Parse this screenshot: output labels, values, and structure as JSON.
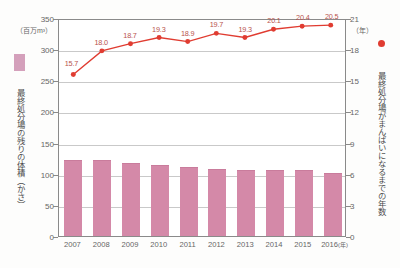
{
  "chart_data": {
    "type": "bar",
    "title": "",
    "subtitle": "",
    "categories": [
      "2007",
      "2008",
      "2009",
      "2010",
      "2011",
      "2012",
      "2013",
      "2014",
      "2015",
      "2016"
    ],
    "xlabel": "(年)",
    "grid": true,
    "legend_position": "outside-left-and-right",
    "series": [
      {
        "name": "最終処分場の残りの体積（かさ）",
        "type": "bar",
        "axis": "left",
        "unit": "（百万m³）",
        "color": "#d489a8",
        "values": [
          120,
          120,
          115,
          112,
          109,
          106,
          104,
          104,
          104,
          99
        ]
      },
      {
        "name": "最終処分場がまんぱいになるまでの年数",
        "type": "line",
        "axis": "right",
        "unit": "（年）",
        "color": "#e03c31",
        "values": [
          15.7,
          18.0,
          18.7,
          19.3,
          18.9,
          19.7,
          19.3,
          20.1,
          20.4,
          20.5
        ],
        "point_labels": [
          "15.7",
          "18.0",
          "18.7",
          "19.3",
          "18.9",
          "19.7",
          "19.3",
          "20.1",
          "20.4",
          "20.5"
        ]
      }
    ],
    "left_axis": {
      "label": "最終処分場の残りの体積（かさ）",
      "unit": "（百万m³）",
      "min": 0,
      "max": 350,
      "tick_step": 50,
      "ticks": [
        "0",
        "50",
        "100",
        "150",
        "200",
        "250",
        "300",
        "350"
      ]
    },
    "right_axis": {
      "label": "最終処分場がまんぱいになるまでの年数",
      "unit": "（年）",
      "min": 0,
      "max": 21,
      "tick_step": 3,
      "ticks": [
        "0",
        "3",
        "6",
        "9",
        "12",
        "15",
        "18",
        "21"
      ]
    },
    "x_axis": {
      "suffix_label": "(年)",
      "last_category_suffix": "2016"
    }
  },
  "colors": {
    "bar": "#d489a8",
    "bar_legend_swatch": "#d4a0bb",
    "line": "#e03c31",
    "marker": "#e03c31",
    "value_label": "#b9544e",
    "grid": "#c9c9c9",
    "axis": "#8a8a8a",
    "background": "#fdfdfc"
  }
}
